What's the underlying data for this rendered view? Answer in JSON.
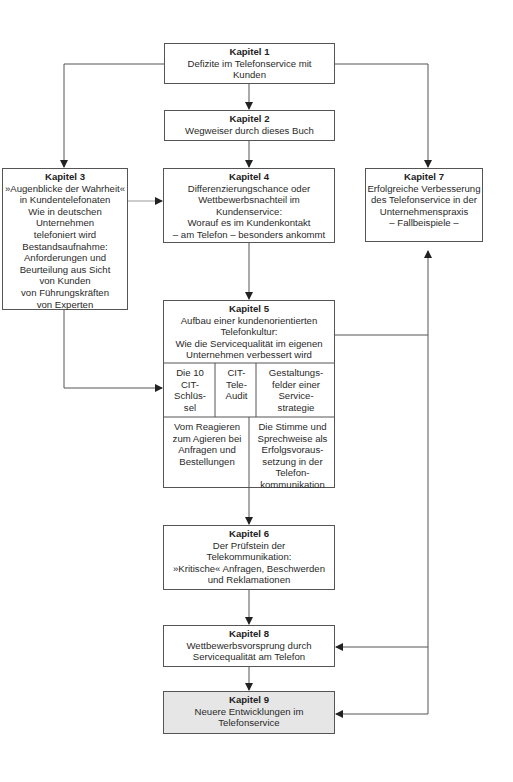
{
  "diagram": {
    "chapters": {
      "k1": {
        "title": "Kapitel 1",
        "desc": "Defizite im Telefonservice mit\nKunden"
      },
      "k2": {
        "title": "Kapitel 2",
        "desc": "Wegweiser durch dieses Buch"
      },
      "k3": {
        "title": "Kapitel 3",
        "desc": "»Augenblicke der Wahrheit«\nin Kundentelefonaten\nWie in deutschen\nUnternehmen\ntelefoniert wird\nBestandsaufnahme:\nAnforderungen und\nBeurteilung aus Sicht\nvon Kunden\nvon Führungskräften\nvon Experten"
      },
      "k4": {
        "title": "Kapitel 4",
        "desc": "Differenzierungschance oder\nWettbewerbsnachteil im\nKundenservice:\nWorauf es im Kundenkontakt\n– am Telefon – besonders ankommt"
      },
      "k5": {
        "title": "Kapitel 5",
        "desc": "Aufbau einer kundenorientierten\nTelefonkultur:\nWie die Servicequalität im eigenen\nUnternehmen verbessert wird",
        "cells": [
          "Die 10\nCIT-\nSchlüs-\nsel",
          "CIT-\nTele-\nAudit",
          "Gestaltungs-\nfelder einer\nService-\nstrategie",
          "Vom Reagieren\nzum Agieren bei\nAnfragen und\nBestellungen",
          "Die Stimme und\nSprechweise als\nErfolgsvoraus-\nsetzung in der\nTelefon-\nkommunikation"
        ]
      },
      "k6": {
        "title": "Kapitel 6",
        "desc": "Der Prüfstein der\nTelekommunikation:\n»Kritische« Anfragen, Beschwerden\nund Reklamationen"
      },
      "k7": {
        "title": "Kapitel 7",
        "desc": "Erfolgreiche Verbesserung\ndes Telefonservice in der\nUnternehmenspraxis\n– Fallbeispiele –"
      },
      "k8": {
        "title": "Kapitel 8",
        "desc": "Wettbewerbsvorsprung durch\nServicequalität am Telefon"
      },
      "k9": {
        "title": "Kapitel 9",
        "desc": "Neuere Entwicklungen im\nTelefonservice"
      }
    },
    "colors": {
      "line": "#555555",
      "highlight_fill": "#e6e6e6"
    }
  }
}
